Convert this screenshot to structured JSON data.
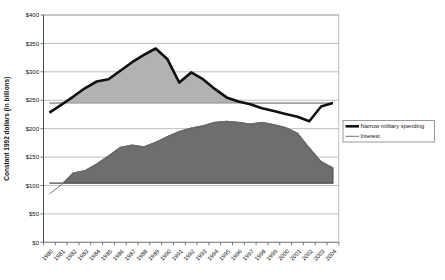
{
  "chart_data": {
    "type": "area",
    "title": "",
    "xlabel": "",
    "ylabel": "Constant 1992 dollars (in billions)",
    "ylim": [
      0,
      400
    ],
    "ytick_interval": 50,
    "ytick_prefix": "$",
    "grid": true,
    "legend_position": "right",
    "categories": [
      "1980",
      "1981",
      "1982",
      "1983",
      "1984",
      "1985",
      "1986",
      "1987",
      "1988",
      "1989",
      "1990",
      "1991",
      "1992",
      "1993",
      "1994",
      "1995",
      "1996",
      "1997",
      "1998",
      "1999",
      "2000",
      "2001",
      "2002",
      "2003",
      "2004"
    ],
    "series": [
      {
        "name": "Narrow military spending",
        "values": [
          228,
          242,
          256,
          271,
          283,
          287,
          302,
          317,
          330,
          341,
          322,
          281,
          299,
          287,
          270,
          255,
          248,
          243,
          236,
          231,
          226,
          221,
          213,
          239,
          245
        ],
        "area_baseline": 245,
        "area_fill": "#b2b2b2",
        "area_edge": "#8a8a8a",
        "line_color": "#111111",
        "line_width": 2.6
      },
      {
        "name": "Interest",
        "values": [
          85,
          101,
          122,
          126,
          138,
          152,
          167,
          171,
          168,
          176,
          186,
          195,
          201,
          205,
          211,
          213,
          211,
          208,
          211,
          207,
          202,
          192,
          166,
          142,
          131
        ],
        "area_baseline": 104,
        "area_fill": "#6e6e6e",
        "area_edge": "#4a4a4a",
        "line_color": "#757575",
        "line_width": 1
      }
    ],
    "colors": {
      "grid": "#a8a8a8",
      "axis": "#4d4d4d",
      "legend_border": "#808080",
      "background": "#ffffff"
    }
  }
}
